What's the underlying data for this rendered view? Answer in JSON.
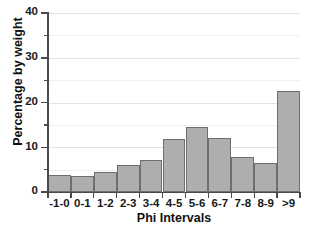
{
  "chart_data": {
    "type": "bar",
    "title": "",
    "xlabel": "Phi Intervals",
    "ylabel": "Percentage by weight",
    "categories": [
      "-1-0",
      "0-1",
      "1-2",
      "2-3",
      "3-4",
      "4-5",
      "5-6",
      "6-7",
      "7-8",
      "8-9",
      ">9"
    ],
    "values": [
      3.8,
      3.6,
      4.4,
      6.0,
      7.1,
      11.8,
      14.5,
      12.0,
      7.8,
      6.4,
      22.6
    ],
    "ylim": [
      0,
      40
    ],
    "xlim_categories": 11,
    "y_major_ticks": [
      0,
      10,
      20,
      30,
      40
    ],
    "y_minor_ticks": [
      5,
      15,
      25,
      35
    ],
    "y_tick_labels": [
      "0",
      "10",
      "20",
      "30",
      "40"
    ],
    "grid": true,
    "grid_axis": "y",
    "legend": false,
    "legend_position": "none",
    "bar_fill_color": "#aeaeae",
    "bar_edge_color": "#6e6e6e",
    "axis_color": "#4a4a4a",
    "gridline_color": "#e2e2e2",
    "background_color": "#ffffff",
    "text_color": "#111111"
  },
  "axes": {
    "x_title": "Phi Intervals",
    "y_title": "Percentage by weight"
  }
}
